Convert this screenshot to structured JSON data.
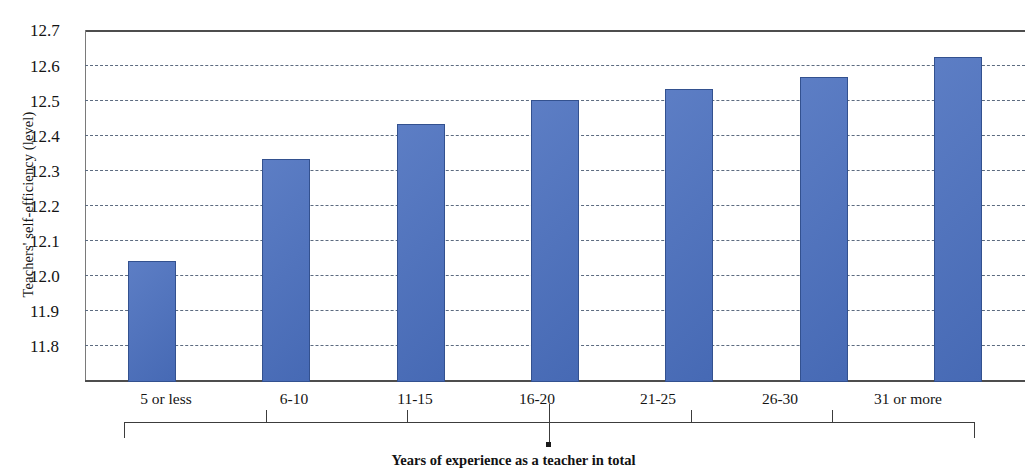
{
  "chart_data": {
    "type": "bar",
    "title": "",
    "xlabel": "Years of experience as a teacher in total",
    "ylabel": "Teachers' self-efficiency (level)",
    "categories": [
      "5 or less",
      "6-10",
      "11-15",
      "16-20",
      "21-25",
      "26-30",
      "31 or more"
    ],
    "values": [
      12.11,
      12.37,
      12.46,
      12.52,
      12.55,
      12.58,
      12.63
    ],
    "series": [
      {
        "name": "Teachers' self-efficiency (level)",
        "values": [
          12.11,
          12.37,
          12.46,
          12.52,
          12.55,
          12.58,
          12.63
        ]
      }
    ],
    "ylim": [
      11.8,
      12.7
    ],
    "ytick_labels": [
      "12.7",
      "12.6",
      "12.5",
      "12.4",
      "12.3",
      "12.2",
      "12.1",
      "12.0",
      "11.9",
      "11.8"
    ],
    "ytick_values": [
      12.7,
      12.6,
      12.5,
      12.4,
      12.3,
      12.2,
      12.1,
      12.0,
      11.9,
      11.8
    ],
    "grid": true,
    "grid_style": "dashed-horizontal",
    "legend": "none",
    "bar_color": "#4a6fbe",
    "bar_border_color": "#33518f",
    "grid_color": "#5c6b80",
    "axis_color": "#4d4d4d"
  },
  "axes": {
    "y_title": "Teachers' self-efficiency (level)",
    "x_title": "Years of experience as a teacher in total"
  }
}
